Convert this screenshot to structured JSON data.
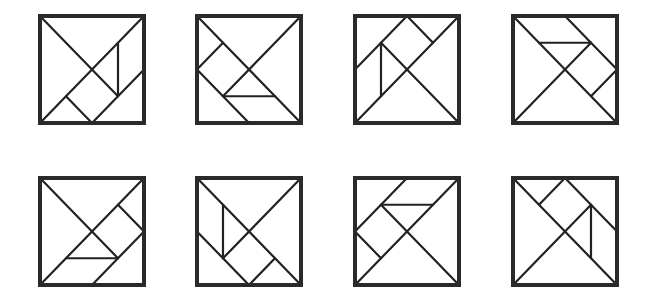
{
  "figure": {
    "stroke_color": "#222222",
    "frame_color": "#2a2a2a",
    "background": "#ffffff",
    "rows": 2,
    "columns": 4
  },
  "tangrams": [
    {
      "id": 1,
      "row": 0,
      "col": 0,
      "left": 38,
      "top": 14,
      "segments": [
        [
          0,
          0,
          0.75,
          0.75
        ],
        [
          0,
          1,
          1,
          0
        ],
        [
          0.75,
          0.25,
          0.75,
          0.75
        ],
        [
          0.25,
          0.75,
          0.5,
          1
        ],
        [
          0.5,
          1,
          1,
          0.5
        ]
      ]
    },
    {
      "id": 2,
      "row": 0,
      "col": 1,
      "left": 195,
      "top": 14,
      "segments": [
        [
          0,
          0,
          1,
          1
        ],
        [
          1,
          0,
          0.25,
          0.75
        ],
        [
          0.25,
          0.75,
          0.75,
          0.75
        ],
        [
          0,
          0.5,
          0.25,
          0.25
        ],
        [
          0,
          0.5,
          0.5,
          1
        ]
      ]
    },
    {
      "id": 3,
      "row": 0,
      "col": 2,
      "left": 353,
      "top": 14,
      "segments": [
        [
          0,
          1,
          1,
          0
        ],
        [
          0.25,
          0.25,
          1,
          1
        ],
        [
          0,
          0.5,
          0.5,
          0
        ],
        [
          0.5,
          0,
          0.75,
          0.25
        ],
        [
          0.25,
          0.25,
          0.25,
          0.75
        ]
      ]
    },
    {
      "id": 4,
      "row": 0,
      "col": 3,
      "left": 511,
      "top": 14,
      "segments": [
        [
          0,
          0,
          1,
          1
        ],
        [
          0,
          1,
          0.75,
          0.25
        ],
        [
          0.25,
          0.25,
          0.75,
          0.25
        ],
        [
          0.5,
          0,
          1,
          0.5
        ],
        [
          1,
          0.5,
          0.75,
          0.75
        ]
      ]
    },
    {
      "id": 5,
      "row": 1,
      "col": 0,
      "left": 38,
      "top": 176,
      "segments": [
        [
          0,
          0,
          0.75,
          0.75
        ],
        [
          0,
          1,
          1,
          0
        ],
        [
          0.25,
          0.75,
          0.75,
          0.75
        ],
        [
          0.75,
          0.25,
          1,
          0.5
        ],
        [
          0.5,
          1,
          1,
          0.5
        ]
      ]
    },
    {
      "id": 6,
      "row": 1,
      "col": 1,
      "left": 195,
      "top": 176,
      "segments": [
        [
          0,
          0,
          1,
          1
        ],
        [
          1,
          0,
          0.25,
          0.75
        ],
        [
          0.25,
          0.25,
          0.25,
          0.75
        ],
        [
          0,
          0.5,
          0.5,
          1
        ],
        [
          0.5,
          1,
          0.75,
          0.75
        ]
      ]
    },
    {
      "id": 7,
      "row": 1,
      "col": 2,
      "left": 353,
      "top": 176,
      "segments": [
        [
          0,
          1,
          1,
          0
        ],
        [
          0.25,
          0.25,
          1,
          1
        ],
        [
          0.25,
          0.25,
          0.75,
          0.25
        ],
        [
          0,
          0.5,
          0.5,
          0
        ],
        [
          0,
          0.5,
          0.25,
          0.75
        ]
      ]
    },
    {
      "id": 8,
      "row": 1,
      "col": 3,
      "left": 511,
      "top": 176,
      "segments": [
        [
          0,
          0,
          1,
          1
        ],
        [
          0,
          1,
          0.75,
          0.25
        ],
        [
          0.75,
          0.25,
          0.75,
          0.75
        ],
        [
          0.5,
          0,
          1,
          0.5
        ],
        [
          0.5,
          0,
          0.25,
          0.25
        ]
      ]
    }
  ]
}
